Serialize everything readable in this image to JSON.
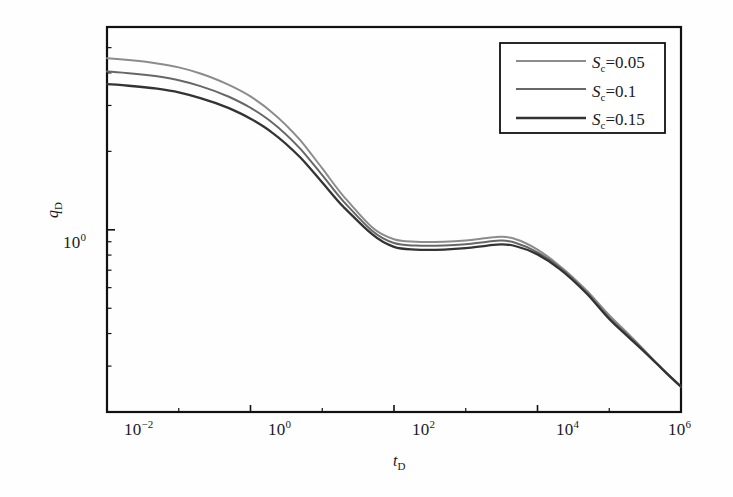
{
  "figure": {
    "background_color": "#fefefe",
    "frame_color": "#111111"
  },
  "axes": {
    "x": {
      "label": "t",
      "label_sub": "D",
      "scale": "log",
      "min_exp": -2,
      "max_exp": 6,
      "tick_labels": [
        "-2",
        "0",
        "2",
        "4",
        "6"
      ],
      "tick_mantissa": "10"
    },
    "y": {
      "label": "q",
      "label_sub": "D",
      "scale": "log",
      "tick_labels": [
        "0"
      ],
      "tick_mantissa": "10"
    }
  },
  "legend": {
    "position": "top-right",
    "entries": [
      {
        "symbol": "S",
        "sub": "c",
        "eq": "=0.05",
        "color": "#8c8c8c"
      },
      {
        "symbol": "S",
        "sub": "c",
        "eq": "=0.1",
        "color": "#676767"
      },
      {
        "symbol": "S",
        "sub": "c",
        "eq": "=0.15",
        "color": "#333333"
      }
    ]
  },
  "chart_data": {
    "type": "line",
    "title": "",
    "xlabel": "tD",
    "ylabel": "qD",
    "xscale": "log",
    "yscale": "log",
    "xlim": [
      0.01,
      1000000
    ],
    "ylim": [
      0.2,
      6
    ],
    "grid": false,
    "legend_position": "top-right",
    "x": [
      0.01,
      0.02,
      0.05,
      0.1,
      0.2,
      0.5,
      1,
      2,
      5,
      10,
      20,
      50,
      100,
      200,
      500,
      1000,
      2000,
      3200,
      5000,
      10000,
      20000,
      50000,
      100000,
      200000,
      500000,
      1000000
    ],
    "series": [
      {
        "name": "Sc=0.05",
        "color": "#8c8c8c",
        "values": [
          4.55,
          4.48,
          4.35,
          4.2,
          3.98,
          3.6,
          3.25,
          2.82,
          2.2,
          1.72,
          1.34,
          1.02,
          0.92,
          0.9,
          0.9,
          0.91,
          0.93,
          0.94,
          0.92,
          0.84,
          0.73,
          0.58,
          0.47,
          0.39,
          0.3,
          0.25
        ]
      },
      {
        "name": "Sc=0.1",
        "color": "#676767",
        "values": [
          4.05,
          3.99,
          3.88,
          3.75,
          3.56,
          3.24,
          2.94,
          2.58,
          2.04,
          1.62,
          1.28,
          0.99,
          0.89,
          0.87,
          0.87,
          0.88,
          0.9,
          0.91,
          0.89,
          0.82,
          0.72,
          0.57,
          0.46,
          0.385,
          0.3,
          0.25
        ]
      },
      {
        "name": "Sc=0.15",
        "color": "#333333",
        "values": [
          3.62,
          3.57,
          3.48,
          3.37,
          3.2,
          2.93,
          2.67,
          2.36,
          1.89,
          1.52,
          1.22,
          0.96,
          0.86,
          0.84,
          0.84,
          0.85,
          0.87,
          0.88,
          0.865,
          0.805,
          0.71,
          0.565,
          0.455,
          0.38,
          0.3,
          0.25
        ]
      }
    ]
  }
}
